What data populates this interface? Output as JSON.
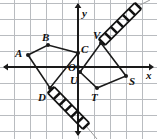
{
  "figure": {
    "width": 157,
    "height": 139,
    "background_color": "#ffffff",
    "grid": {
      "visible": true,
      "spacing_px": 16,
      "color": "#b9bcc0",
      "line_width": 1
    },
    "axes": {
      "color": "#1a1a1a",
      "line_width": 2,
      "origin_px": {
        "x": 78,
        "y": 67
      },
      "x_axis_label": "x",
      "y_axis_label": "y",
      "origin_label": "O",
      "arrowheads": [
        "left",
        "right",
        "up",
        "down"
      ]
    },
    "shape_color": "#1a1a1a",
    "shape_line_width": 1.6,
    "vertex_dot_color": "#1a1a1a",
    "vertex_dot_radius": 2.0
  },
  "shapes": [
    {
      "name": "quadrilateral-abcd",
      "label": "ABCD",
      "closed": true,
      "vertices": [
        {
          "label": "A",
          "px": {
            "x": 28,
            "y": 55
          },
          "grid": {
            "x": -3.1,
            "y": 0.75
          },
          "label_px": {
            "x": 15,
            "y": 48
          }
        },
        {
          "label": "B",
          "px": {
            "x": 48,
            "y": 45
          },
          "grid": {
            "x": -1.9,
            "y": 1.4
          },
          "label_px": {
            "x": 42,
            "y": 32
          }
        },
        {
          "label": "C",
          "px": {
            "x": 78,
            "y": 53
          },
          "grid": {
            "x": 0,
            "y": 0.9
          },
          "label_px": {
            "x": 81,
            "y": 44
          }
        },
        {
          "label": "D",
          "px": {
            "x": 50,
            "y": 88
          },
          "grid": {
            "x": -1.75,
            "y": -1.3
          },
          "label_px": {
            "x": 38,
            "y": 92
          }
        }
      ]
    },
    {
      "name": "quadrilateral-uvst",
      "label": "UVST",
      "closed": true,
      "vertices": [
        {
          "label": "U",
          "px": {
            "x": 80,
            "y": 72
          },
          "grid": {
            "x": 0.1,
            "y": -0.3
          },
          "label_px": {
            "x": 70,
            "y": 75
          }
        },
        {
          "label": "V",
          "px": {
            "x": 101,
            "y": 43
          },
          "grid": {
            "x": 1.4,
            "y": 1.5
          },
          "label_px": {
            "x": 93,
            "y": 30
          }
        },
        {
          "label": "S",
          "px": {
            "x": 126,
            "y": 76
          },
          "grid": {
            "x": 3.0,
            "y": -0.55
          },
          "label_px": {
            "x": 129,
            "y": 76
          }
        },
        {
          "label": "T",
          "px": {
            "x": 97,
            "y": 88
          },
          "grid": {
            "x": 1.2,
            "y": -1.3
          },
          "label_px": {
            "x": 91,
            "y": 92
          }
        }
      ]
    }
  ],
  "hatched_marks": [
    {
      "name": "hatch-band-upper-right",
      "from_px": {
        "x": 102,
        "y": 42
      },
      "to_px": {
        "x": 138,
        "y": 6
      },
      "band_width_px": 9,
      "stripe_count": 6,
      "color": "#111111",
      "tail_px": {
        "x": 150,
        "y": 0
      }
    },
    {
      "name": "hatch-band-lower-left",
      "from_px": {
        "x": 51,
        "y": 90
      },
      "to_px": {
        "x": 86,
        "y": 126
      },
      "band_width_px": 9,
      "stripe_count": 6,
      "color": "#111111",
      "tail_px": {
        "x": 97,
        "y": 139
      }
    }
  ],
  "point_labels": [
    {
      "text": "A",
      "x": 15,
      "y": 48
    },
    {
      "text": "B",
      "x": 42,
      "y": 32
    },
    {
      "text": "C",
      "x": 81,
      "y": 44
    },
    {
      "text": "D",
      "x": 38,
      "y": 92
    },
    {
      "text": "O",
      "x": 68,
      "y": 62
    },
    {
      "text": "U",
      "x": 70,
      "y": 75
    },
    {
      "text": "V",
      "x": 93,
      "y": 30
    },
    {
      "text": "S",
      "x": 129,
      "y": 76
    },
    {
      "text": "T",
      "x": 91,
      "y": 92
    },
    {
      "text": "x",
      "x": 146,
      "y": 70
    },
    {
      "text": "y",
      "x": 82,
      "y": 8
    }
  ]
}
